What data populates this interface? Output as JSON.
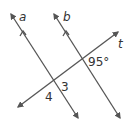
{
  "diagram": {
    "lines": {
      "a": {
        "label": "a"
      },
      "b": {
        "label": "b"
      },
      "t": {
        "label": "t"
      }
    },
    "angles": {
      "given": {
        "label": "95°"
      },
      "angle3": {
        "label": "3"
      },
      "angle4": {
        "label": "4"
      }
    },
    "colors": {
      "line": "#555555",
      "text": "#333333",
      "background": "#ffffff"
    }
  }
}
